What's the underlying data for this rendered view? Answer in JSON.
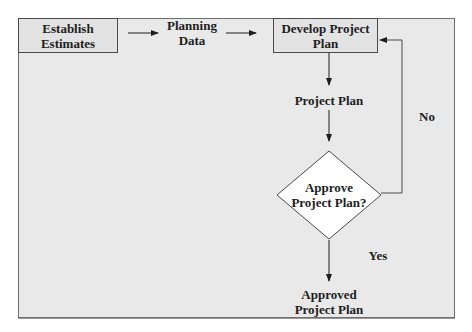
{
  "diagram": {
    "type": "flowchart",
    "colors": {
      "background": "#e9e9e9",
      "border": "#4a4a4a",
      "text": "#1e1e1e",
      "decision_fill": "#ffffff"
    },
    "nodes": {
      "establish": {
        "line1": "Establish",
        "line2": "Estimates",
        "shape": "process"
      },
      "planning_data": {
        "line1": "Planning",
        "line2": "Data",
        "shape": "data-label"
      },
      "develop": {
        "line1": "Develop Project",
        "line2": "Plan",
        "shape": "process"
      },
      "project_plan": {
        "label": "Project Plan",
        "shape": "data-label"
      },
      "approve": {
        "line1": "Approve",
        "line2": "Project Plan?",
        "shape": "decision"
      },
      "approved": {
        "line1": "Approved",
        "line2": "Project Plan",
        "shape": "data-label"
      }
    },
    "edges": {
      "no_label": "No",
      "yes_label": "Yes"
    }
  }
}
